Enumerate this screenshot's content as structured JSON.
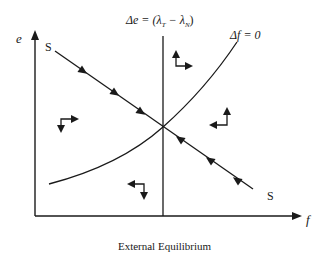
{
  "figure": {
    "caption": "External Equilibrium",
    "axes": {
      "y_label": "e",
      "x_label": "f"
    },
    "curves": {
      "saddle_path_label_top": "S",
      "saddle_path_label_bottom": "S",
      "delta_e_label_lhs": "Δe = (λ",
      "delta_e_sub_T": "T",
      "delta_e_mid": " − λ",
      "delta_e_sub_N": "N",
      "delta_e_rhs": ")",
      "delta_f_label": "Δf = 0"
    },
    "phase_arrows": [
      {
        "region": "upper-left",
        "vertical": "down",
        "horizontal": "right"
      },
      {
        "region": "upper-right",
        "vertical": "up",
        "horizontal": "right"
      },
      {
        "region": "lower-right",
        "vertical": "up",
        "horizontal": "left"
      },
      {
        "region": "lower-left",
        "vertical": "down",
        "horizontal": "left"
      }
    ],
    "colors": {
      "ink": "#1a1a1a",
      "background": "#ffffff"
    }
  }
}
